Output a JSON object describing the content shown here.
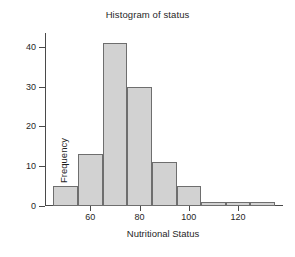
{
  "chart_data": {
    "type": "bar",
    "title": "Histogram of status",
    "xlabel": "Nutritional Status",
    "ylabel": "Frequency",
    "bin_width": 10,
    "bin_starts": [
      45,
      55,
      65,
      75,
      85,
      95,
      105,
      115,
      125
    ],
    "bin_ends": [
      55,
      65,
      75,
      85,
      95,
      105,
      115,
      125,
      135
    ],
    "categories": [
      "45-55",
      "55-65",
      "65-75",
      "75-85",
      "85-95",
      "95-105",
      "105-115",
      "115-125",
      "125-135"
    ],
    "values": [
      5,
      13,
      41,
      30,
      11,
      5,
      1,
      1,
      1
    ],
    "xlim": [
      42,
      137
    ],
    "ylim": [
      0,
      43
    ],
    "x_ticks": [
      60,
      80,
      100,
      120
    ],
    "x_tick_labels": [
      "60",
      "80",
      "100",
      "120"
    ],
    "y_ticks": [
      0,
      10,
      20,
      30,
      40
    ],
    "y_tick_labels": [
      "0",
      "10",
      "20",
      "30",
      "40"
    ],
    "grid": false,
    "legend": false,
    "bar_fill_color": "#d2d2d2",
    "bar_border_color": "#6e6e6e",
    "axis_color": "#4a4a4a",
    "text_color": "#1f1f1f",
    "background_color": "#ffffff"
  }
}
